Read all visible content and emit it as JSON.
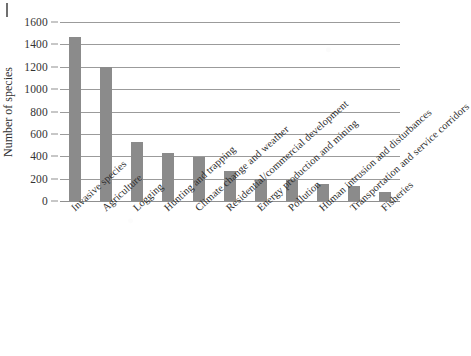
{
  "chart_data": {
    "type": "bar",
    "title": "",
    "subtitle": "",
    "xlabel": "",
    "ylabel": "Number of species",
    "ylim": [
      0,
      1600
    ],
    "yticks": [
      0,
      200,
      400,
      600,
      800,
      1000,
      1200,
      1400,
      1600
    ],
    "ytick_labels": [
      "0",
      "200",
      "400",
      "600",
      "800",
      "1000",
      "1200",
      "1400",
      "1600"
    ],
    "grid": true,
    "legend": null,
    "legend_position": "none",
    "bar_color": "#8b8b8b",
    "categories": [
      "Invasive species",
      "Agriculture",
      "Logging",
      "Hunting and trapping",
      "Climate change and weather",
      "Residential/commercial development",
      "Energy production and mining",
      "Pollution",
      "Human intrusion and disturbances",
      "Transportation and service corridors",
      "Fisheries"
    ],
    "values": [
      1470,
      1200,
      530,
      425,
      390,
      270,
      195,
      192,
      150,
      130,
      85
    ]
  },
  "axis": {
    "y_title": "Number of species"
  }
}
